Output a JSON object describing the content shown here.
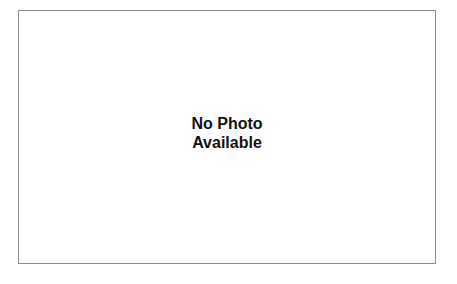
{
  "placeholder": {
    "line1": "No Photo",
    "line2": "Available"
  },
  "colors": {
    "border": "#8a8a8a",
    "text": "#111111",
    "background": "#ffffff"
  }
}
